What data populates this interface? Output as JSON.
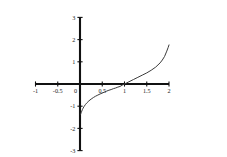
{
  "chart_data": {
    "type": "line",
    "title": "",
    "subtitle": "",
    "xlabel": "",
    "ylabel": "",
    "xlim": [
      -1,
      2
    ],
    "ylim": [
      -3,
      3
    ],
    "grid": false,
    "legend": false,
    "legend_position": "none",
    "background_color": "#ffffff",
    "axis_color": "#111111",
    "curve_color": "#3b3b3b",
    "x_ticks": [
      {
        "value": -1,
        "label": "-1"
      },
      {
        "value": -0.5,
        "label": "-0.5"
      },
      {
        "value": 0,
        "label": "0"
      },
      {
        "value": 0.5,
        "label": "0.5"
      },
      {
        "value": 1,
        "label": "1"
      },
      {
        "value": 1.5,
        "label": "1.5"
      },
      {
        "value": 2,
        "label": "2"
      }
    ],
    "y_ticks": [
      {
        "value": 3,
        "label": "3"
      },
      {
        "value": 2,
        "label": "2"
      },
      {
        "value": 1,
        "label": "1"
      },
      {
        "value": 0,
        "label": "0"
      },
      {
        "value": -1,
        "label": "-1"
      },
      {
        "value": -2,
        "label": "-2"
      },
      {
        "value": -3,
        "label": "-3"
      }
    ],
    "series": [
      {
        "name": "curve",
        "x": [
          0.015,
          0.02,
          0.03,
          0.04,
          0.055,
          0.07,
          0.09,
          0.12,
          0.15,
          0.2,
          0.25,
          0.3,
          0.35,
          0.4,
          0.45,
          0.5,
          0.55,
          0.6,
          0.65,
          0.7,
          0.75,
          0.8,
          0.85,
          0.9,
          0.95,
          1.0,
          1.05,
          1.1,
          1.2,
          1.3,
          1.4,
          1.5,
          1.6,
          1.7,
          1.8,
          1.85,
          1.9,
          1.95,
          1.98,
          2.0
        ],
        "y": [
          -1.36,
          -1.33,
          -1.28,
          -1.22,
          -1.15,
          -1.09,
          -1.02,
          -0.93,
          -0.86,
          -0.76,
          -0.68,
          -0.61,
          -0.55,
          -0.5,
          -0.45,
          -0.41,
          -0.36,
          -0.32,
          -0.28,
          -0.25,
          -0.21,
          -0.18,
          -0.14,
          -0.11,
          -0.05,
          0.0,
          0.05,
          0.1,
          0.2,
          0.3,
          0.4,
          0.5,
          0.62,
          0.76,
          0.95,
          1.08,
          1.24,
          1.48,
          1.64,
          1.76
        ]
      }
    ],
    "x_axis_crossing": 1.0,
    "curve_min_y": -1.36,
    "curve_max_y": 1.76
  }
}
